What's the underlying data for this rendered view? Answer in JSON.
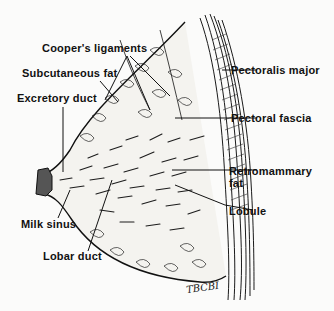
{
  "diagram": {
    "labels_left": [
      {
        "id": "coopers-ligaments",
        "text": "Cooper's ligaments"
      },
      {
        "id": "subcutaneous-fat",
        "text": "Subcutaneous fat"
      },
      {
        "id": "excretory-duct",
        "text": "Excretory duct"
      },
      {
        "id": "milk-sinus",
        "text": "Milk sinus"
      },
      {
        "id": "lobar-duct",
        "text": "Lobar duct"
      }
    ],
    "labels_right": [
      {
        "id": "pectoralis-major",
        "text": "Pectoralis major"
      },
      {
        "id": "pectoral-fascia",
        "text": "Pectoral fascia"
      },
      {
        "id": "retromammary-fat",
        "text": "Retromammary",
        "text2": "fat"
      },
      {
        "id": "lobule",
        "text": "Lobule"
      }
    ],
    "signature": "TBCBI",
    "colors": {
      "ink": "#111111",
      "background": "#fbfbfa"
    }
  }
}
